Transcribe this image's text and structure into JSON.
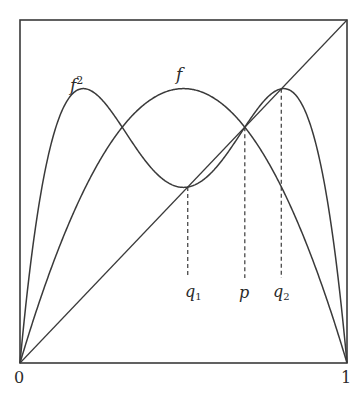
{
  "diagram": {
    "title": "",
    "type": "cobweb-fixed-points",
    "colors": {
      "stroke": "#3a3a3a",
      "background": "#ffffff",
      "text": "#2a2a2a"
    },
    "axis": {
      "x_min_label": "0",
      "x_max_label": "1"
    },
    "curves": [
      {
        "id": "f",
        "label": "f",
        "description": "logistic map r·x(1−x)"
      },
      {
        "id": "f2",
        "label": "f",
        "superscript": "2",
        "description": "second iterate f∘f"
      },
      {
        "id": "identity",
        "label": "",
        "description": "diagonal y = x"
      }
    ],
    "parameter_r": 3.2,
    "markers": [
      {
        "id": "q1",
        "label": "q",
        "subscript": "1",
        "x": 0.513
      },
      {
        "id": "p",
        "label": "p",
        "subscript": "",
        "x": 0.6875
      },
      {
        "id": "q2",
        "label": "q",
        "subscript": "2",
        "x": 0.799
      }
    ]
  }
}
